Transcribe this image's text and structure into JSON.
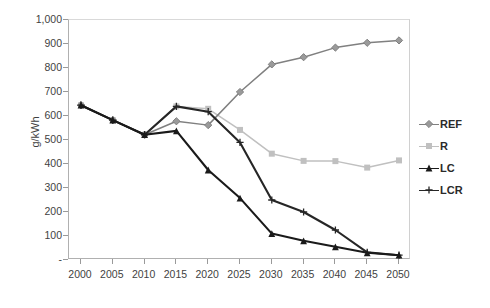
{
  "chart_data": {
    "type": "line",
    "title": "",
    "xlabel": "",
    "ylabel": "g/kWh",
    "x": [
      2000,
      2005,
      2010,
      2015,
      2020,
      2025,
      2030,
      2035,
      2040,
      2045,
      2050
    ],
    "categories": [
      "2000",
      "2005",
      "2010",
      "2015",
      "2020",
      "2025",
      "2030",
      "2035",
      "2040",
      "2045",
      "2050"
    ],
    "xlim": [
      2000,
      2050
    ],
    "ylim": [
      0,
      1000
    ],
    "y_ticks": [
      "-",
      "100",
      "200",
      "300",
      "400",
      "500",
      "600",
      "700",
      "800",
      "900",
      "1,000"
    ],
    "y_tick_values": [
      0,
      100,
      200,
      300,
      400,
      500,
      600,
      700,
      800,
      900,
      1000
    ],
    "grid": false,
    "legend_position": "right",
    "series": [
      {
        "name": "REF",
        "marker": "diamond",
        "color": "#808080",
        "values": [
          645,
          583,
          522,
          578,
          562,
          700,
          815,
          845,
          885,
          905,
          915
        ]
      },
      {
        "name": "R",
        "marker": "square",
        "color": "#c0c0c0",
        "values": [
          645,
          583,
          522,
          640,
          630,
          542,
          443,
          413,
          412,
          385,
          415
        ]
      },
      {
        "name": "LC",
        "marker": "triangle",
        "color": "#1a1a1a",
        "values": [
          645,
          583,
          522,
          538,
          375,
          258,
          110,
          80,
          55,
          30,
          20
        ]
      },
      {
        "name": "LCR",
        "marker": "cross",
        "color": "#262626",
        "values": [
          645,
          583,
          522,
          640,
          618,
          490,
          250,
          200,
          125,
          32,
          20
        ]
      }
    ]
  },
  "legend": {
    "items": [
      {
        "label": "REF",
        "icon": "diamond-marker-icon"
      },
      {
        "label": "R",
        "icon": "square-marker-icon"
      },
      {
        "label": "LC",
        "icon": "triangle-marker-icon"
      },
      {
        "label": "LCR",
        "icon": "cross-marker-icon"
      }
    ]
  }
}
